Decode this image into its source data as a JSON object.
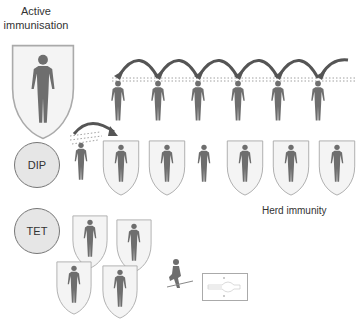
{
  "title": "Active\nimmunisation",
  "title_line1": "Active",
  "title_line2": "immunisation",
  "circles": [
    {
      "label": "DIP"
    },
    {
      "label": "TET"
    }
  ],
  "herd_label": "Herd immunity",
  "colors": {
    "figure": "#6e6e6e",
    "shield_fill": "#f4f4f4",
    "shield_stroke": "#aaaaaa",
    "circle_fill": "#e6e6e6",
    "arrow": "#555555"
  },
  "top_row": {
    "people": 6,
    "arrows": 6
  },
  "dip_row": {
    "shielded": [
      false,
      true,
      true,
      false,
      true,
      true,
      true
    ]
  },
  "tet_group": {
    "shielded_people": 4
  }
}
